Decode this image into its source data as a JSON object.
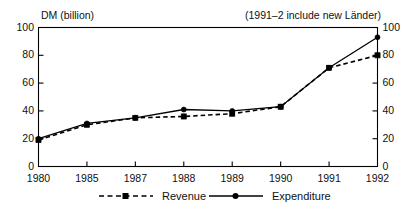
{
  "chart_data": {
    "type": "line",
    "title": "",
    "xlabel": "",
    "ylabel": "DM (billion)",
    "annotation": "(1991–2 include new Länder)",
    "categories": [
      "1980",
      "1985",
      "1987",
      "1988",
      "1989",
      "1990",
      "1991",
      "1992"
    ],
    "ylim": [
      0,
      100
    ],
    "yticks": [
      0,
      20,
      40,
      60,
      80,
      100
    ],
    "ytick_labels": [
      "0",
      "20",
      "40",
      "60",
      "80",
      "100"
    ],
    "right_axis": {
      "ylim": [
        0,
        100
      ],
      "yticks": [
        0,
        20,
        40,
        60,
        80,
        100
      ],
      "ytick_labels": [
        "0",
        "20",
        "40",
        "60",
        "80",
        "100"
      ]
    },
    "grid": false,
    "legend_position": "below",
    "series": [
      {
        "name": "Revenue",
        "line_style": "dashed",
        "marker": "square",
        "color": "#000000",
        "values": [
          19,
          30,
          35,
          36,
          38,
          43,
          71,
          80
        ]
      },
      {
        "name": "Expenditure",
        "line_style": "solid",
        "marker": "circle",
        "color": "#000000",
        "values": [
          20,
          31,
          35,
          41,
          40,
          43,
          71,
          93
        ]
      }
    ]
  },
  "axis": {
    "y_label": "DM (billion)",
    "note": "(1991–2 include new Länder)"
  },
  "legend": {
    "revenue_label": "Revenue",
    "expenditure_label": "Expenditure"
  }
}
